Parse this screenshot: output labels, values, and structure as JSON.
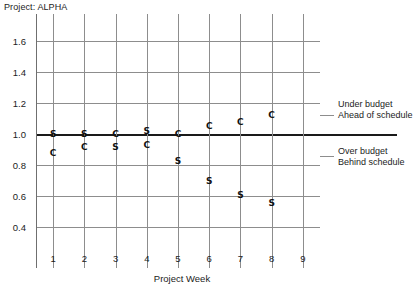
{
  "title": "Project: ALPHA",
  "annotations": {
    "upper_line1": "Under budget",
    "upper_line2": "Ahead of schedule",
    "lower_line1": "Over budget",
    "lower_line2": "Behind schedule"
  },
  "chart_data": {
    "type": "scatter",
    "title": "Project: ALPHA",
    "xlabel": "Project Week",
    "ylabel": "",
    "x": [
      1,
      2,
      3,
      4,
      5,
      6,
      7,
      8,
      9
    ],
    "xticklabels": [
      "1",
      "2",
      "3",
      "4",
      "5",
      "6",
      "7",
      "8",
      "9"
    ],
    "xlim": [
      0.45,
      9.55
    ],
    "ylim": [
      0.3,
      1.72
    ],
    "yticks": [
      0.4,
      0.6,
      0.8,
      1.0,
      1.2,
      1.4,
      1.6
    ],
    "yticklabels": [
      "0.4",
      "0.6",
      "0.8",
      "1.0",
      "1.2",
      "1.4",
      "1.6"
    ],
    "grid": true,
    "reference_line": 1.0,
    "legend": "none",
    "series": [
      {
        "name": "C",
        "marker": "C",
        "values": [
          0.88,
          0.92,
          1.0,
          0.93,
          1.0,
          1.05,
          1.08,
          1.12
        ],
        "x": [
          1,
          2,
          3,
          4,
          5,
          6,
          7,
          8
        ]
      },
      {
        "name": "S",
        "marker": "S",
        "values": [
          1.0,
          1.0,
          0.92,
          1.02,
          0.83,
          0.7,
          0.61,
          0.56
        ],
        "x": [
          1,
          2,
          3,
          4,
          5,
          6,
          7,
          8
        ]
      }
    ],
    "annotations": [
      {
        "text": "Under budget",
        "y": 1.18
      },
      {
        "text": "Ahead of schedule",
        "y": 1.1
      },
      {
        "text": "Over budget",
        "y": 0.86
      },
      {
        "text": "Behind schedule",
        "y": 0.78
      }
    ]
  },
  "colors": {
    "grid": "#8d8d8d",
    "axis": "#6f6f6f",
    "reference": "#1a1a1a",
    "text": "#1c1c1c",
    "background": "#ffffff"
  }
}
